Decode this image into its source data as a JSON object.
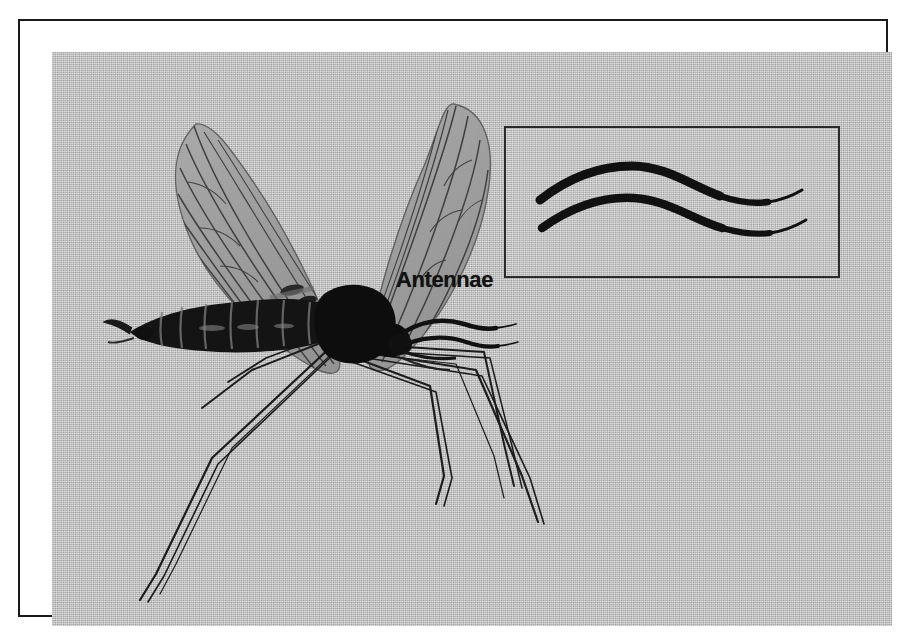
{
  "figure": {
    "kind": "halftone-illustration",
    "frame": {
      "border_color": "#1a1a1a",
      "matte_color": "#ffffff"
    },
    "plate": {
      "background_color": "#b9b9b9",
      "ink_color": "#111111"
    }
  },
  "labels": {
    "antennae": "Antennae"
  },
  "inset": {
    "name": "antennae-magnified-inset",
    "border_color": "#2a2a2a",
    "stroke_color": "#111111",
    "count": 2,
    "description": "Two magnified antennae shown as thick tapering S-curves"
  },
  "anatomy": {
    "wings": {
      "count": 2,
      "fill_color": "#9a9a9a",
      "vein_color": "#3a3a3a"
    },
    "thorax": {
      "fill_color": "#0d0d0d"
    },
    "head": {
      "fill_color": "#0d0d0d"
    },
    "abdomen": {
      "segments": 8,
      "fill_color": "#121212",
      "band_color": "#6f6f6f"
    },
    "legs": {
      "count": 6,
      "stroke_color": "#1c1c1c"
    },
    "antennae": {
      "count": 2,
      "stroke_color": "#111111"
    },
    "halteres": {
      "count": 2,
      "fill_color": "#2a2a2a"
    }
  }
}
